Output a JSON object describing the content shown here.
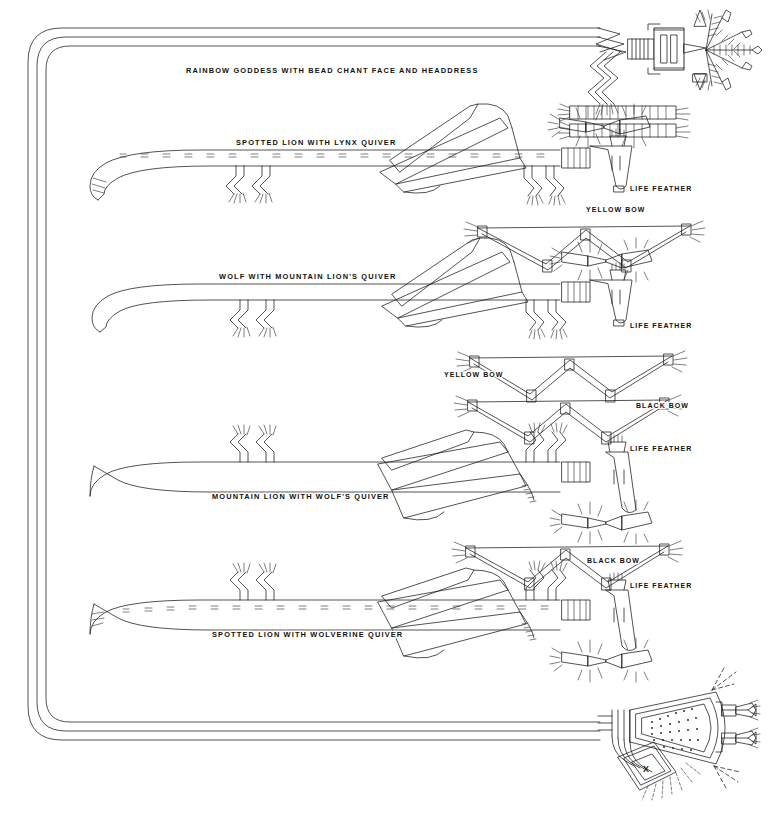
{
  "plate": {
    "title_caption": "",
    "kind": "navajo-sandpainting-line-drawing",
    "background_color": "#ffffff",
    "ink_color": "#1a1a1a"
  },
  "labels": {
    "figure_1": "RAINBOW GODDESS WITH BEAD CHANT FACE AND HEADDRESS",
    "figure_2": "SPOTTED LION WITH LYNX QUIVER",
    "figure_3": "WOLF WITH MOUNTAIN LION'S QUIVER",
    "figure_4": "MOUNTAIN LION WITH WOLF'S QUIVER",
    "figure_5": "SPOTTED LION WITH WOLVERINE QUIVER",
    "life_feather_1": "LIFE FEATHER",
    "life_feather_2": "LIFE FEATHER",
    "life_feather_3": "LIFE FEATHER",
    "life_feather_4": "LIFE FEATHER",
    "yellow_bow_1": "YELLOW BOW",
    "yellow_bow_2": "YELLOW BOW",
    "black_bow_1": "BLACK BOW",
    "black_bow_2": "BLACK BOW"
  },
  "label_positions": {
    "figure_1": {
      "x": 186,
      "y": 73
    },
    "figure_2": {
      "x": 236,
      "y": 145
    },
    "figure_3": {
      "x": 219,
      "y": 279
    },
    "figure_4": {
      "x": 212,
      "y": 499
    },
    "figure_5": {
      "x": 212,
      "y": 637
    },
    "life_feather_1": {
      "x": 630,
      "y": 191
    },
    "life_feather_2": {
      "x": 630,
      "y": 328
    },
    "life_feather_3": {
      "x": 630,
      "y": 451
    },
    "life_feather_4": {
      "x": 630,
      "y": 588
    },
    "yellow_bow_1": {
      "x": 586,
      "y": 212
    },
    "yellow_bow_2": {
      "x": 444,
      "y": 377
    },
    "black_bow_1": {
      "x": 636,
      "y": 408
    },
    "black_bow_2": {
      "x": 587,
      "y": 563
    }
  },
  "elements": {
    "rainbow_border": {
      "name": "rainbow-guardian-border",
      "strands": 3,
      "description": "three concentric rounded lines forming left, top and bottom enclosure"
    },
    "figures": [
      {
        "id": "rainbow-goddess",
        "row": 1,
        "body_y": 45,
        "has_spots": false,
        "quiver": "bead-chant-headdress"
      },
      {
        "id": "spotted-lion-lynx",
        "row": 2,
        "body_y": 157,
        "has_spots": true,
        "quiver": "lynx"
      },
      {
        "id": "wolf-mountain-lion",
        "row": 3,
        "body_y": 290,
        "has_spots": false,
        "quiver": "mountain-lion"
      },
      {
        "id": "mountain-lion-wolf",
        "row": 4,
        "body_y": 465,
        "has_spots": false,
        "quiver": "wolf"
      },
      {
        "id": "spotted-lion-wolverine",
        "row": 5,
        "body_y": 603,
        "has_spots": true,
        "quiver": "wolverine"
      }
    ],
    "bows": [
      {
        "id": "yellow-bow-1",
        "color_name": "yellow",
        "y": 232
      },
      {
        "id": "yellow-bow-2",
        "color_name": "yellow",
        "y": 368
      },
      {
        "id": "black-bow-1",
        "color_name": "black",
        "y": 414
      },
      {
        "id": "black-bow-2",
        "color_name": "black",
        "y": 554
      }
    ],
    "bottom_figure": {
      "id": "rainbow-bundle-terminus",
      "description": "fan-shaped dotted triangle with X-marked diamond and feather rays",
      "mark": "X"
    }
  }
}
